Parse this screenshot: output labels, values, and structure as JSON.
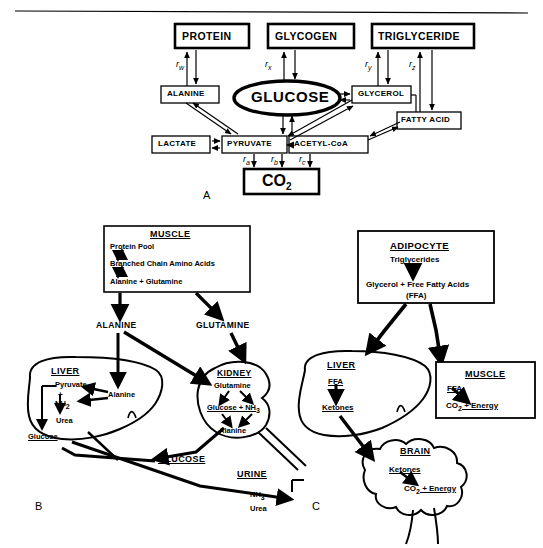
{
  "figure": {
    "panels": [
      "A",
      "B",
      "C"
    ],
    "line_color": "#000000",
    "background": "#ffffff"
  },
  "panel_a": {
    "letter": "A",
    "stores": [
      {
        "name": "PROTEIN"
      },
      {
        "name": "GLYCOGEN"
      },
      {
        "name": "TRIGLYCERIDE"
      }
    ],
    "central": "GLUCOSE",
    "intermediates": [
      {
        "name": "ALANINE"
      },
      {
        "name": "GLYCEROL"
      },
      {
        "name": "FATTY ACID"
      },
      {
        "name": "LACTATE"
      },
      {
        "name": "PYRUVATE"
      },
      {
        "name": "ACETYL-CoA"
      }
    ],
    "endproduct": {
      "name": "CO",
      "sub": "2"
    },
    "rates_top": [
      {
        "base": "r",
        "sub": "w"
      },
      {
        "base": "r",
        "sub": "x"
      },
      {
        "base": "r",
        "sub": "y"
      },
      {
        "base": "r",
        "sub": "z"
      }
    ],
    "rates_bottom": [
      {
        "base": "r",
        "sub": "a"
      },
      {
        "base": "r",
        "sub": "b"
      },
      {
        "base": "r",
        "sub": "c"
      }
    ]
  },
  "panel_b": {
    "letter": "B",
    "muscle": {
      "title": "MUSCLE",
      "lines": [
        "Protein Pool",
        "Branched Chain Amino Acids",
        "Alanine  +  Glutamine"
      ]
    },
    "flux_labels": [
      "ALANINE",
      "GLUTAMINE"
    ],
    "liver": {
      "title": "LIVER",
      "lines": [
        "Pyruvate",
        "+",
        "NH",
        "Urea",
        "Glucose",
        "Alanine"
      ],
      "nh2_base": "NH",
      "nh2_sub": "2"
    },
    "kidney": {
      "title": "KIDNEY",
      "lines": [
        "Glutamine",
        "Glucose  +  NH",
        "Alanine"
      ],
      "nh3_base": "NH",
      "nh3_sub": "3"
    },
    "outputs": {
      "glucose": "GLUCOSE"
    },
    "urine": {
      "title": "URINE",
      "nh3_base": "NH",
      "nh3_sub": "3",
      "urea": "Urea"
    }
  },
  "panel_c": {
    "letter": "C",
    "adipocyte": {
      "title": "ADIPOCYTE",
      "lines": [
        "Triglycerides",
        "Glycerol  +  Free Fatty Acids",
        "(FFA)"
      ]
    },
    "liver": {
      "title": "LIVER",
      "input": "FFA",
      "output": "Ketones"
    },
    "muscle": {
      "title": "MUSCLE",
      "input": "FFA",
      "output_base": "CO",
      "output_sub": "2",
      "output_tail": " +  Energy"
    },
    "brain": {
      "title": "BRAIN",
      "input": "Ketones",
      "output_base": "CO",
      "output_sub": "2",
      "output_tail": " +  Energy"
    }
  }
}
